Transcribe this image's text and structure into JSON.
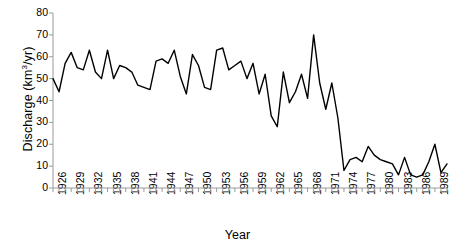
{
  "chart_data": {
    "type": "line",
    "title": "",
    "xlabel": "Year",
    "ylabel": "Discharge (km3/yr)",
    "ylabel_parts": {
      "text": "Discharge (km",
      "sup": "3",
      "tail": "/yr)"
    },
    "ylim": [
      0,
      80
    ],
    "ytick_step": 10,
    "yticks": [
      0,
      10,
      20,
      30,
      40,
      50,
      60,
      70,
      80
    ],
    "xlim": [
      1926,
      1991
    ],
    "xtick_step_labels": 3,
    "xtick_step_minor": 1,
    "xticks": [
      1926,
      1929,
      1932,
      1935,
      1938,
      1941,
      1944,
      1947,
      1950,
      1953,
      1956,
      1959,
      1962,
      1965,
      1968,
      1971,
      1974,
      1977,
      1980,
      1983,
      1986,
      1989
    ],
    "grid": false,
    "legend": "none",
    "line_color": "#000000",
    "line_width": 1.4,
    "x": [
      1926,
      1927,
      1928,
      1929,
      1930,
      1931,
      1932,
      1933,
      1934,
      1935,
      1936,
      1937,
      1938,
      1939,
      1940,
      1941,
      1942,
      1943,
      1944,
      1945,
      1946,
      1947,
      1948,
      1949,
      1950,
      1951,
      1952,
      1953,
      1954,
      1955,
      1956,
      1957,
      1958,
      1959,
      1960,
      1961,
      1962,
      1963,
      1964,
      1965,
      1966,
      1967,
      1968,
      1969,
      1970,
      1971,
      1972,
      1973,
      1974,
      1975,
      1976,
      1977,
      1978,
      1979,
      1980,
      1981,
      1982,
      1983,
      1984,
      1985,
      1986,
      1987,
      1988,
      1989,
      1990,
      1991
    ],
    "values": [
      50,
      44,
      57,
      62,
      55,
      54,
      63,
      53,
      50,
      63,
      50,
      56,
      55,
      53,
      47,
      46,
      45,
      58,
      59,
      57,
      63,
      51,
      43,
      61,
      56,
      46,
      45,
      63,
      64,
      54,
      56,
      58,
      50,
      57,
      43,
      52,
      33,
      28,
      53,
      39,
      44,
      52,
      41,
      70,
      48,
      36,
      48,
      32,
      8,
      13,
      14,
      12,
      19,
      15,
      13,
      12,
      11,
      6,
      14,
      6,
      5,
      6,
      12,
      20,
      7,
      11
    ]
  }
}
